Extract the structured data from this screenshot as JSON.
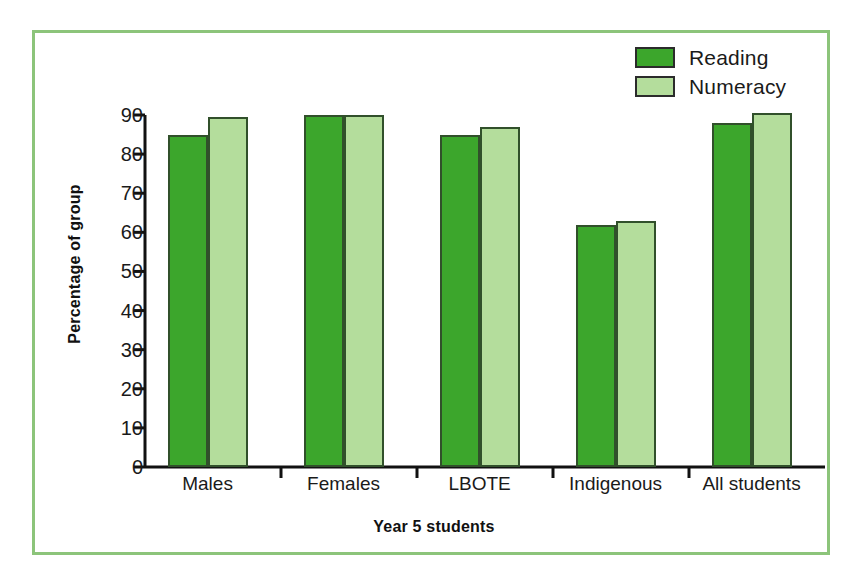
{
  "chart_data": {
    "type": "bar",
    "title": "",
    "xlabel": "Year 5 students",
    "ylabel": "Percentage of group",
    "categories": [
      "Males",
      "Females",
      "LBOTE",
      "Indigenous",
      "All students"
    ],
    "series": [
      {
        "name": "Reading",
        "color": "#3ca62c",
        "values": [
          85,
          90,
          85,
          62,
          88
        ]
      },
      {
        "name": "Numeracy",
        "color": "#b4dd9c",
        "values": [
          89.5,
          90,
          87,
          63,
          90.5
        ]
      }
    ],
    "ylim": [
      0,
      90
    ],
    "ytick_labels": [
      "0",
      "10",
      "20",
      "30",
      "40",
      "50",
      "60",
      "70",
      "80",
      "90"
    ],
    "ytick_values": [
      0,
      10,
      20,
      30,
      40,
      50,
      60,
      70,
      80,
      90
    ],
    "grid": false,
    "legend_position": "top-right",
    "frame_color": "#8cc47a",
    "bar_outline_color": "#31502b",
    "axis_color": "#111111"
  },
  "legend": {
    "entries": [
      {
        "label": "Reading"
      },
      {
        "label": "Numeracy"
      }
    ]
  }
}
